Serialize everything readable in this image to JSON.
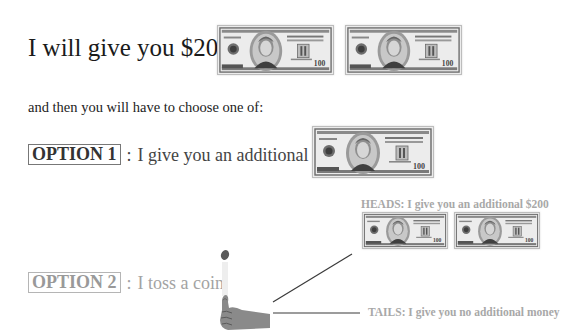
{
  "header": {
    "title": "I will give you $200:",
    "subtitle": "and then you will have to choose one of:"
  },
  "initial_gift": {
    "amount": "$200",
    "bills": [
      {
        "icon": "hundred-dollar-bill-icon",
        "denomination": "100"
      },
      {
        "icon": "hundred-dollar-bill-icon",
        "denomination": "100"
      }
    ]
  },
  "options": [
    {
      "badge": "OPTION 1",
      "separator": ":",
      "text": "I give you an additional $100:",
      "color": "#444444",
      "bills": [
        {
          "icon": "hundred-dollar-bill-icon",
          "denomination": "100"
        }
      ]
    },
    {
      "badge": "OPTION 2",
      "separator": ":",
      "text": "I toss a coin",
      "color": "#a3a3a3",
      "icon": "thumb-coin-toss-icon",
      "outcomes": {
        "heads": {
          "label": "HEADS: I give you an additional $200",
          "bills": [
            {
              "icon": "hundred-dollar-bill-icon",
              "denomination": "100"
            },
            {
              "icon": "hundred-dollar-bill-icon",
              "denomination": "100"
            }
          ]
        },
        "tails": {
          "label": "TAILS: I give you no additional money"
        }
      }
    }
  ],
  "colors": {
    "title": "#1a1a1a",
    "outcome_text": "#a8a8a8",
    "connector_line": "#333333"
  }
}
